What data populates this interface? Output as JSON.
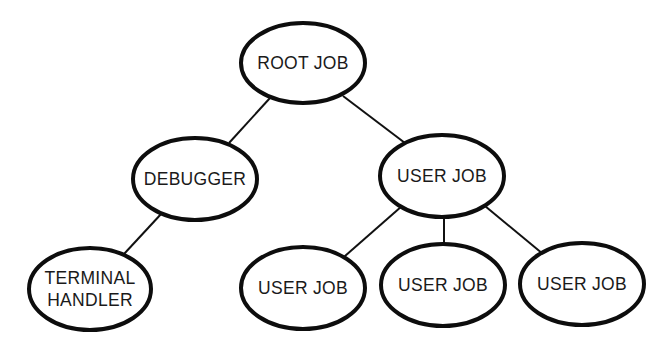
{
  "diagram": {
    "type": "tree",
    "colors": {
      "background": "#ffffff",
      "stroke": "#0d0d0d",
      "text": "#1a1a1a"
    },
    "nodes": [
      {
        "id": "root",
        "lines": [
          "ROOT JOB"
        ],
        "cx": 303,
        "cy": 63,
        "rx": 62,
        "ry": 40
      },
      {
        "id": "debugger",
        "lines": [
          "DEBUGGER"
        ],
        "cx": 195,
        "cy": 179,
        "rx": 62,
        "ry": 41
      },
      {
        "id": "user-job-main",
        "lines": [
          "USER JOB"
        ],
        "cx": 442,
        "cy": 176,
        "rx": 62,
        "ry": 41
      },
      {
        "id": "terminal-handler",
        "lines": [
          "TERMINAL",
          "HANDLER"
        ],
        "cx": 90,
        "cy": 289,
        "rx": 61,
        "ry": 41
      },
      {
        "id": "user-job-1",
        "lines": [
          "USER JOB"
        ],
        "cx": 303,
        "cy": 288,
        "rx": 62,
        "ry": 41
      },
      {
        "id": "user-job-2",
        "lines": [
          "USER JOB"
        ],
        "cx": 443,
        "cy": 285,
        "rx": 62,
        "ry": 41
      },
      {
        "id": "user-job-3",
        "lines": [
          "USER JOB"
        ],
        "cx": 582,
        "cy": 284,
        "rx": 62,
        "ry": 41
      }
    ],
    "edges": [
      {
        "from": "root",
        "to": "debugger",
        "x1": 270,
        "y1": 98,
        "x2": 229,
        "y2": 143
      },
      {
        "from": "root",
        "to": "user-job-main",
        "x1": 343,
        "y1": 96,
        "x2": 405,
        "y2": 143
      },
      {
        "from": "debugger",
        "to": "terminal-handler",
        "x1": 162,
        "y1": 213,
        "x2": 124,
        "y2": 254
      },
      {
        "from": "user-job-main",
        "to": "user-job-1",
        "x1": 402,
        "y1": 206,
        "x2": 345,
        "y2": 256
      },
      {
        "from": "user-job-main",
        "to": "user-job-2",
        "x1": 444,
        "y1": 217,
        "x2": 444,
        "y2": 244
      },
      {
        "from": "user-job-main",
        "to": "user-job-3",
        "x1": 485,
        "y1": 206,
        "x2": 543,
        "y2": 254
      }
    ]
  }
}
